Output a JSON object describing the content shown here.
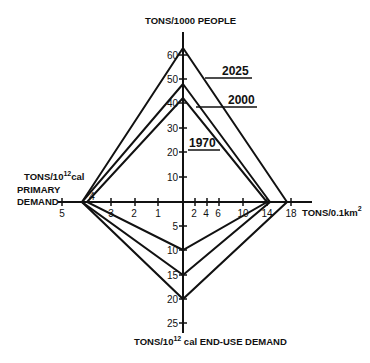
{
  "axes": {
    "top": {
      "title": "TONS/1000 PEOPLE",
      "ticks": [
        "10",
        "20",
        "30",
        "40",
        "50",
        "60"
      ]
    },
    "left": {
      "title_line1": "TONS/10",
      "title_sup": "12",
      "title_unit": "cal",
      "title_line2": "PRIMARY",
      "title_line3": "DEMAND",
      "ticks": [
        "1",
        "2",
        "3",
        "4",
        "5"
      ]
    },
    "right": {
      "title": "TONS/0.1km",
      "title_sup": "2",
      "ticks": [
        "2",
        "4",
        "6",
        "10",
        "14",
        "18"
      ]
    },
    "bottom": {
      "title_pre": "TONS/10",
      "title_sup": "12",
      "title_post": " cal END-USE DEMAND",
      "ticks": [
        "5",
        "10",
        "15",
        "20",
        "25"
      ]
    }
  },
  "series": [
    {
      "name": "2025",
      "top": 63,
      "left": 4.0,
      "right": 17.5,
      "bottom": 20
    },
    {
      "name": "2000",
      "top": 48,
      "left": 4.0,
      "right": 12.8,
      "bottom": 15
    },
    {
      "name": "1970",
      "top": 42,
      "left": 3.8,
      "right": 12.5,
      "bottom": 10
    }
  ],
  "colors": {
    "line": "#111111",
    "background": "#ffffff"
  }
}
